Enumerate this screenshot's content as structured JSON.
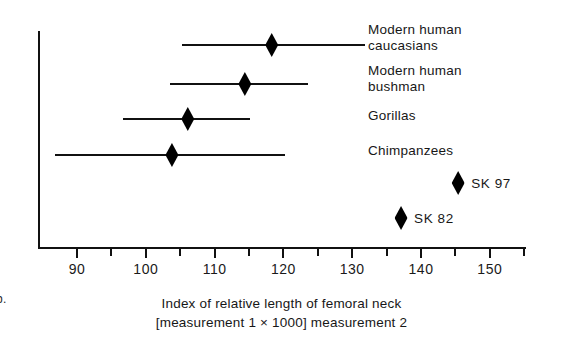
{
  "panel": {
    "letter": "b."
  },
  "chart_data": {
    "type": "scatter",
    "title": "",
    "subtitle": "",
    "xlabel": "Index of relative length of femoral neck [measurement 1 × 1000] measurement 2",
    "xlabel_lines": [
      "Index of relative length of femoral neck",
      "[measurement 1 × 1000] measurement 2"
    ],
    "ylabel": "",
    "xlim": [
      86,
      156
    ],
    "grid": false,
    "legend": "none",
    "axis_ticks": [
      {
        "value": 90,
        "label": "90",
        "major": true
      },
      {
        "value": 95,
        "label": "",
        "major": false
      },
      {
        "value": 100,
        "label": "100",
        "major": true
      },
      {
        "value": 105,
        "label": "",
        "major": false
      },
      {
        "value": 110,
        "label": "110",
        "major": true
      },
      {
        "value": 115,
        "label": "",
        "major": false
      },
      {
        "value": 120,
        "label": "120",
        "major": true
      },
      {
        "value": 125,
        "label": "",
        "major": false
      },
      {
        "value": 130,
        "label": "130",
        "major": true
      },
      {
        "value": 135,
        "label": "",
        "major": false
      },
      {
        "value": 140,
        "label": "140",
        "major": true
      },
      {
        "value": 145,
        "label": "",
        "major": false
      },
      {
        "value": 150,
        "label": "150",
        "major": true
      },
      {
        "value": 155,
        "label": "",
        "major": false
      }
    ],
    "range_rows": [
      {
        "label": "Modern human\ncaucasians",
        "mean": 118.3,
        "min": 105.3,
        "max": 131.9
      },
      {
        "label": "Modern human\nbushman",
        "mean": 114.4,
        "min": 103.5,
        "max": 123.6
      },
      {
        "label": "Gorillas",
        "mean": 106.1,
        "min": 96.7,
        "max": 115.1
      },
      {
        "label": "Chimpanzees",
        "mean": 103.8,
        "min": 86.8,
        "max": 120.2
      }
    ],
    "specimen_points": [
      {
        "label": "SK 97",
        "value": 145.4
      },
      {
        "label": "SK 82",
        "value": 137.1
      }
    ]
  }
}
